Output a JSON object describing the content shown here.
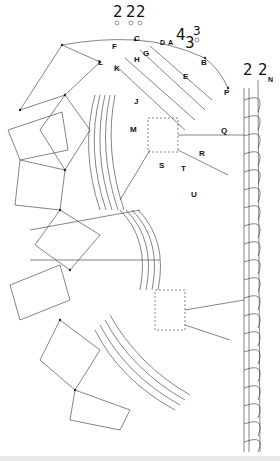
{
  "diagram": {
    "type": "bobbin-lace-working-diagram",
    "pair_counts_top": [
      {
        "value": "2",
        "x": 110,
        "y": 6
      },
      {
        "value": "2",
        "x": 128,
        "y": 6
      },
      {
        "value": "2",
        "x": 138,
        "y": 6
      }
    ],
    "pair_counts_right_top": [
      {
        "value": "4",
        "x": 178,
        "y": 30
      },
      {
        "value": "3",
        "x": 187,
        "y": 37
      },
      {
        "value": "3",
        "x": 194,
        "y": 26
      }
    ],
    "pair_counts_edge": [
      {
        "value": "2",
        "x": 244,
        "y": 62
      },
      {
        "value": "2",
        "x": 259,
        "y": 62
      }
    ],
    "point_labels": [
      {
        "label": "C",
        "x": 134,
        "y": 35
      },
      {
        "label": "D",
        "x": 161,
        "y": 39
      },
      {
        "label": "A",
        "x": 169,
        "y": 39
      },
      {
        "label": "F",
        "x": 112,
        "y": 43
      },
      {
        "label": "G",
        "x": 143,
        "y": 51
      },
      {
        "label": "B",
        "x": 201,
        "y": 59
      },
      {
        "label": "L",
        "x": 98,
        "y": 60
      },
      {
        "label": "H",
        "x": 134,
        "y": 56
      },
      {
        "label": "K",
        "x": 114,
        "y": 66
      },
      {
        "label": "E",
        "x": 183,
        "y": 74
      },
      {
        "label": "N",
        "x": 268,
        "y": 77
      },
      {
        "label": "P",
        "x": 224,
        "y": 90
      },
      {
        "label": "J",
        "x": 134,
        "y": 99
      },
      {
        "label": "M",
        "x": 130,
        "y": 127
      },
      {
        "label": "Q",
        "x": 221,
        "y": 128
      },
      {
        "label": "R",
        "x": 199,
        "y": 151
      },
      {
        "label": "S",
        "x": 159,
        "y": 163
      },
      {
        "label": "T",
        "x": 181,
        "y": 166
      },
      {
        "label": "U",
        "x": 191,
        "y": 192
      }
    ],
    "legend": []
  },
  "colors": {
    "ink": "#222222",
    "paper": "#ffffff",
    "edge": "#e9e9e9"
  }
}
